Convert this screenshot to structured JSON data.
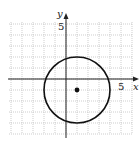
{
  "chart_data": {
    "type": "scatter",
    "title": "",
    "xlabel": "x",
    "ylabel": "y",
    "xlim": [
      -5,
      6
    ],
    "ylim": [
      -5,
      5
    ],
    "grid": true,
    "tick_labels": {
      "x": "5",
      "y": "5"
    },
    "curves": [
      {
        "name": "circle",
        "shape": "circle",
        "center": [
          1,
          -1
        ],
        "radius": 3
      }
    ],
    "points": [
      {
        "name": "center",
        "x": 1,
        "y": -1
      }
    ]
  },
  "labels": {
    "x_axis": "x",
    "y_axis": "y",
    "x_tick": "5",
    "y_tick": "5"
  }
}
